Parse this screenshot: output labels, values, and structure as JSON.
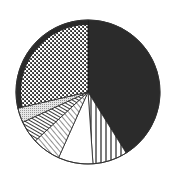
{
  "chart_data": {
    "type": "pie",
    "title": "",
    "legend": [],
    "start_angle_deg": 0,
    "direction": "clockwise",
    "center": [
      88,
      92
    ],
    "radius": 72,
    "slices": [
      {
        "name": "slice-1",
        "fill": "solid-dark",
        "value": 41.1,
        "color": "#2a2a2a"
      },
      {
        "name": "slice-2",
        "fill": "vertical-lines",
        "value": 7.8,
        "color": "#ffffff"
      },
      {
        "name": "slice-3",
        "fill": "white",
        "value": 7.8,
        "color": "#ffffff"
      },
      {
        "name": "slice-4",
        "fill": "diagonal-lines",
        "value": 6.4,
        "color": "#ffffff"
      },
      {
        "name": "slice-5",
        "fill": "dense-diagonal-stripes",
        "value": 5.0,
        "color": "#333333"
      },
      {
        "name": "slice-6",
        "fill": "light-dots",
        "value": 3.3,
        "color": "#dddddd"
      },
      {
        "name": "slice-7",
        "fill": "crosshatch",
        "value": 28.6,
        "color": "#888888"
      }
    ],
    "values": [
      41.1,
      7.8,
      7.8,
      6.4,
      5.0,
      3.3,
      28.6
    ],
    "categories": [
      "slice-1",
      "slice-2",
      "slice-3",
      "slice-4",
      "slice-5",
      "slice-6",
      "slice-7"
    ],
    "xlabel": "",
    "ylabel": ""
  }
}
